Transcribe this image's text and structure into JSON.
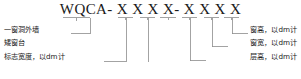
{
  "diagram": {
    "type": "code-designation-callout",
    "title_segments": [
      {
        "text": "WQCA-",
        "kind": "prefix"
      },
      {
        "text": "X X X X-",
        "kind": "digits"
      },
      {
        "text": "X X X X",
        "kind": "digits"
      }
    ],
    "title_full": "WQCA- X X X X- X X X X",
    "left_labels": [
      {
        "id": "label-wall-type",
        "text": "一窗洞外墙"
      },
      {
        "id": "label-low-sill",
        "text": "矮窗台"
      },
      {
        "id": "label-mark-width",
        "text": "标志宽度，以dm计"
      }
    ],
    "right_labels": [
      {
        "id": "label-window-height",
        "text": "窗高，以dm计"
      },
      {
        "id": "label-window-width",
        "text": "窗宽，以dm计"
      },
      {
        "id": "label-storey-height",
        "text": "层高，以dm计"
      }
    ],
    "line_color": "#8c8c8c",
    "text_color": "#1a1a1a",
    "background_color": "#ffffff"
  }
}
